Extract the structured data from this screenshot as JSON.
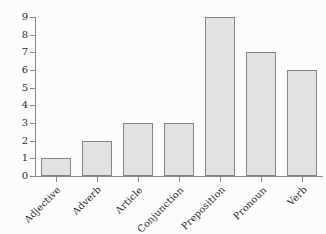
{
  "chart_data": {
    "type": "bar",
    "title": "",
    "subtitle": "",
    "xlabel": "",
    "ylabel": "",
    "categories": [
      "Adjective",
      "Adverb",
      "Article",
      "Conjunction",
      "Preposition",
      "Pronoun",
      "Verb"
    ],
    "values": [
      1,
      2,
      3,
      3,
      9,
      7,
      6
    ],
    "ylim": [
      0,
      9
    ],
    "yticks": [
      "0",
      "1",
      "2",
      "3",
      "4",
      "5",
      "6",
      "7",
      "8",
      "9"
    ],
    "grid": false,
    "legend": false,
    "legend_position": "none",
    "orientation": "vertical",
    "xtick_label_rotation": -45,
    "colors": {
      "bar_fill": "#e2e2e2",
      "bar_border": "#858585",
      "axis": "#8a8a8a",
      "text": "#2b2b2b",
      "background": "#fcfcfc"
    }
  }
}
